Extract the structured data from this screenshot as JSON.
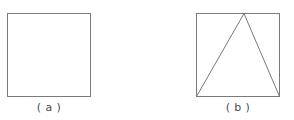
{
  "document": {
    "kind": "line-drawing-diagram",
    "background_color": "#ffffff",
    "stroke_color": "#7a7a7a",
    "caption_color": "#4a4a4a",
    "canvas": {
      "width": 294,
      "height": 120
    }
  },
  "figures": [
    {
      "id": "a",
      "caption": "( a )",
      "shapes": [
        {
          "name": "square-outline",
          "type": "rect",
          "x": 7,
          "y": 13,
          "width": 84,
          "height": 84,
          "stroke": "#7a7a7a",
          "stroke_width": 1,
          "fill": "none"
        }
      ]
    },
    {
      "id": "b",
      "caption": "( b )",
      "shapes": [
        {
          "name": "square-outline",
          "type": "rect",
          "x": 49,
          "y": 13,
          "width": 84,
          "height": 84,
          "stroke": "#7a7a7a",
          "stroke_width": 1,
          "fill": "none"
        },
        {
          "name": "inscribed-triangle",
          "type": "polygon",
          "points": "49,97 97,13 133,97",
          "stroke": "#7a7a7a",
          "stroke_width": 1,
          "fill": "none"
        }
      ]
    }
  ]
}
